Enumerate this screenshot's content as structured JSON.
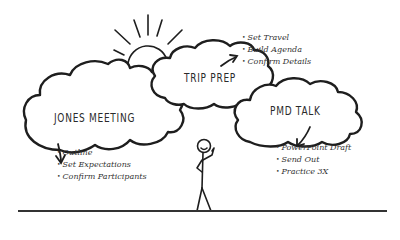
{
  "colors": {
    "ink": "#1e1e1e",
    "text": "#2a2a2a",
    "background": "#ffffff"
  },
  "clouds": [
    {
      "id": "jones",
      "title": "JONES MEETING",
      "items": [
        "Outline",
        "Set Expectations",
        "Confirm Participants"
      ]
    },
    {
      "id": "trip",
      "title": "TRIP PREP",
      "items": [
        "Set Travel",
        "Build Agenda",
        "Confirm Details"
      ]
    },
    {
      "id": "pmd",
      "title": "PMD TALK",
      "items": [
        "PowerPoint Draft",
        "Send Out",
        "Practice 3X"
      ]
    }
  ],
  "decorations": {
    "sun": "sun-icon",
    "figure": "stick-figure-icon",
    "ground": "ground-line"
  }
}
